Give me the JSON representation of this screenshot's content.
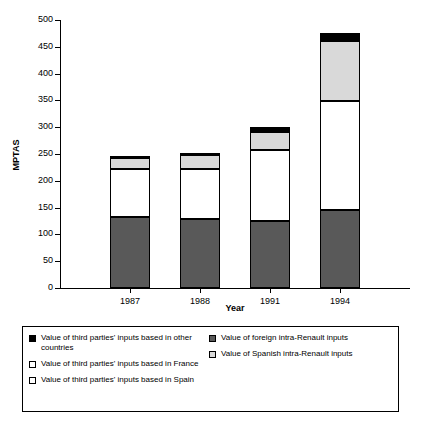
{
  "chart_data": {
    "type": "bar",
    "subtype": "stacked",
    "title": "",
    "xlabel": "Year",
    "ylabel": "MPTAS",
    "categories": [
      "1987",
      "1988",
      "1991",
      "1994"
    ],
    "ylim": [
      0,
      500
    ],
    "yticks": [
      0,
      50,
      100,
      150,
      200,
      250,
      300,
      350,
      400,
      450,
      500
    ],
    "grid": false,
    "legend_position": "bottom",
    "series": [
      {
        "name": "Value of Spanish intra-Renault inputs",
        "color": "#d9d9d9",
        "swatch": "sw-light",
        "values": [
          89,
          94,
          133,
          203
        ]
      },
      {
        "name": "Value of third parties' inputs based in Spain",
        "color": "#595959",
        "swatch": "sw-dark",
        "values": [
          133,
          128,
          125,
          145
        ]
      },
      {
        "name": "Value of third parties' inputs based in France",
        "color": "#ffffff",
        "swatch": "sw-white",
        "values": [
          20,
          26,
          34,
          112
        ]
      },
      {
        "name": "Value of foreign intra-Renault inputs",
        "color": "#595959",
        "swatch": "sw-dark",
        "values": [
          0,
          0,
          0,
          0
        ]
      },
      {
        "name": "Value of third parties' inputs based in other countries",
        "color": "#000000",
        "swatch": "sw-black",
        "values": [
          3,
          4,
          8,
          15
        ]
      }
    ],
    "stack_boundaries": [
      {
        "category": "1987",
        "segments": [
          0,
          133,
          222,
          242,
          245
        ],
        "total": 245
      },
      {
        "category": "1988",
        "segments": [
          0,
          128,
          222,
          248,
          252
        ],
        "total": 252
      },
      {
        "category": "1991",
        "segments": [
          0,
          125,
          258,
          292,
          300
        ],
        "total": 300
      },
      {
        "category": "1994",
        "segments": [
          0,
          145,
          348,
          460,
          475
        ],
        "total": 475
      }
    ]
  },
  "axes": {
    "y_title": "MPTAS",
    "x_title": "Year",
    "y_tick_labels": [
      "0",
      "50",
      "100",
      "150",
      "200",
      "250",
      "300",
      "350",
      "400",
      "450",
      "500"
    ],
    "x_tick_labels": [
      "1987",
      "1988",
      "1991",
      "1994"
    ]
  },
  "legend": {
    "left_column": [
      {
        "swatch": "sw-black",
        "label": "Value of third parties' inputs based in other countries"
      },
      {
        "swatch": "sw-white",
        "label": "Value of third parties' inputs based in France"
      },
      {
        "swatch": "sw-white",
        "label": "Value of third parties' inputs based in Spain"
      }
    ],
    "right_column": [
      {
        "swatch": "sw-dark",
        "label": "Value of foreign intra-Renault inputs"
      },
      {
        "swatch": "sw-light",
        "label": "Value of Spanish intra-Renault inputs"
      }
    ]
  }
}
